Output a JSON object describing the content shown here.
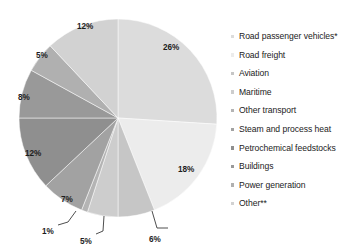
{
  "chart_data": {
    "type": "pie",
    "title": "",
    "subtitle": "",
    "xlabel": "",
    "ylabel": "",
    "legend_position": "right",
    "grid": false,
    "unit": "%",
    "start_angle_deg": 0,
    "direction": "clockwise",
    "categories": [
      "Road passenger vehicles*",
      "Road freight",
      "Aviation",
      "Maritime",
      "Other transport",
      "Steam and process heat",
      "Petrochemical feedstocks",
      "Buildings",
      "Power generation",
      "Other**"
    ],
    "values": [
      26,
      18,
      6,
      5,
      1,
      7,
      12,
      8,
      5,
      12
    ],
    "value_labels": [
      "26%",
      "18%",
      "6%",
      "5%",
      "1%",
      "7%",
      "12%",
      "8%",
      "5%",
      "12%"
    ],
    "colors": [
      "#dcdcdc",
      "#ececec",
      "#c6c6c6",
      "#cdcdcd",
      "#b4b4b4",
      "#a2a2a2",
      "#8f8f8f",
      "#999999",
      "#b0b0b0",
      "#d2d2d2"
    ],
    "callout_indices": [
      2,
      3,
      4
    ],
    "annotations": [
      "*",
      "**"
    ]
  },
  "pie": {
    "center_x": 118,
    "center_y": 118,
    "radius": 99,
    "inner_labels": [
      {
        "text": "26%",
        "x": 163,
        "y": 44
      },
      {
        "text": "18%",
        "x": 178,
        "y": 166
      },
      {
        "text": "7%",
        "x": 61,
        "y": 196
      },
      {
        "text": "12%",
        "x": 25,
        "y": 150
      },
      {
        "text": "8%",
        "x": 18,
        "y": 94
      },
      {
        "text": "5%",
        "x": 36,
        "y": 52
      },
      {
        "text": "12%",
        "x": 77,
        "y": 23
      }
    ],
    "callouts": [
      {
        "text": "6%",
        "x": 149,
        "y": 236
      },
      {
        "text": "5%",
        "x": 80,
        "y": 238
      },
      {
        "text": "1%",
        "x": 42,
        "y": 228
      }
    ]
  },
  "legend": {
    "items": [
      {
        "label": "Road passenger vehicles*",
        "color": "#dcdcdc"
      },
      {
        "label": "Road freight",
        "color": "#ececec"
      },
      {
        "label": "Aviation",
        "color": "#c6c6c6"
      },
      {
        "label": "Maritime",
        "color": "#cdcdcd"
      },
      {
        "label": "Other transport",
        "color": "#b4b4b4"
      },
      {
        "label": "Steam and process heat",
        "color": "#a2a2a2"
      },
      {
        "label": "Petrochemical feedstocks",
        "color": "#8f8f8f"
      },
      {
        "label": "Buildings",
        "color": "#999999"
      },
      {
        "label": "Power generation",
        "color": "#b0b0b0"
      },
      {
        "label": "Other**",
        "color": "#d2d2d2"
      }
    ]
  }
}
